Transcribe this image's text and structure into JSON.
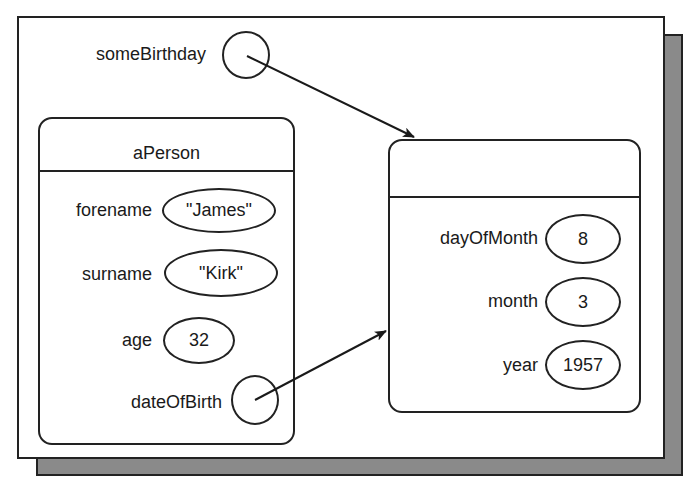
{
  "diagram": {
    "variable": {
      "name": "someBirthday",
      "kind": "reference"
    },
    "person_object": {
      "title": "aPerson",
      "fields": [
        {
          "name": "forename",
          "value": "\"James\""
        },
        {
          "name": "surname",
          "value": "\"Kirk\""
        },
        {
          "name": "age",
          "value": "32"
        },
        {
          "name": "dateOfBirth",
          "value": null,
          "kind": "reference"
        }
      ]
    },
    "date_object": {
      "title": "",
      "fields": [
        {
          "name": "dayOfMonth",
          "value": "8"
        },
        {
          "name": "month",
          "value": "3"
        },
        {
          "name": "year",
          "value": "1957"
        }
      ]
    },
    "arrows": [
      {
        "from": "someBirthday",
        "to": "date_object"
      },
      {
        "from": "aPerson.dateOfBirth",
        "to": "date_object"
      }
    ]
  }
}
